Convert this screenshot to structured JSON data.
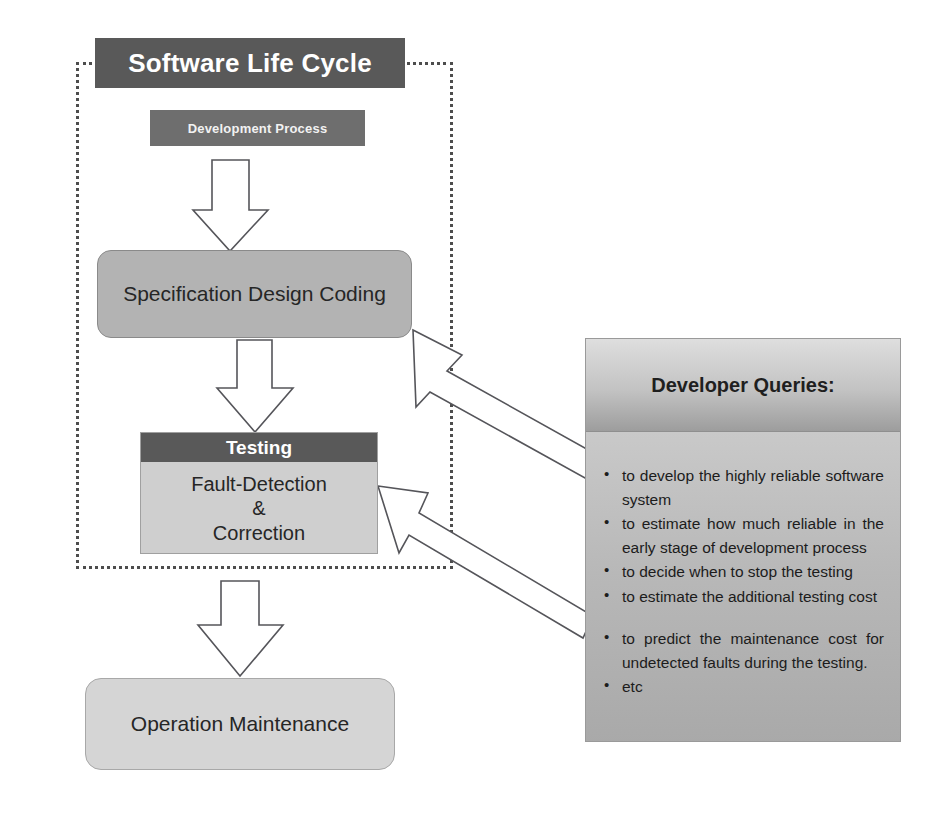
{
  "diagram": {
    "title": "Software Life Cycle",
    "region_label": "software-life-cycle-dotted-boundary",
    "nodes": {
      "development_process": "Development Process",
      "specification": "Specification Design Coding",
      "testing_header": "Testing",
      "testing_line1": "Fault-Detection",
      "testing_line2": "&",
      "testing_line3": "Correction",
      "operation": "Operation Maintenance"
    },
    "panel": {
      "title": "Developer Queries:",
      "bullets": [
        "to develop the highly reliable software system",
        "to estimate how much reliable in the early stage of development process",
        "to decide when to stop the testing",
        "to estimate the additional testing cost",
        "to predict the maintenance cost for undetected faults during the testing.",
        "etc"
      ]
    },
    "arrows": {
      "flow_1": "development-process-to-specification",
      "flow_2": "specification-to-testing",
      "flow_3": "testing-to-operation",
      "query_1": "queries-to-specification",
      "query_2": "queries-to-testing"
    },
    "colors": {
      "title_bar": "#595959",
      "development_process": "#6e6e6e",
      "specification": "#b3b3b3",
      "testing_header": "#595959",
      "testing_body": "#cfcfcf",
      "operation": "#d5d5d5",
      "panel_body": "#b5b5b5",
      "arrow_fill": "#ffffff",
      "arrow_stroke": "#55555a",
      "dotted_border": "#4d4d4d"
    }
  }
}
